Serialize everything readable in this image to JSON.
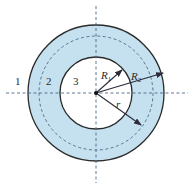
{
  "figure": {
    "colors": {
      "shell_fill": "#c5e1ef",
      "outline": "#2b2b2b",
      "axis": "#4a6a88",
      "arrow": "#2b2b3a"
    },
    "regions": [
      {
        "id": "region-1",
        "label": "1"
      },
      {
        "id": "region-2",
        "label": "2"
      },
      {
        "id": "region-3",
        "label": "3"
      }
    ],
    "radii": {
      "inner": {
        "symbol": "R",
        "subscript": "1"
      },
      "outer": {
        "symbol": "R",
        "subscript": "2"
      },
      "variable": {
        "symbol": "r"
      }
    }
  }
}
